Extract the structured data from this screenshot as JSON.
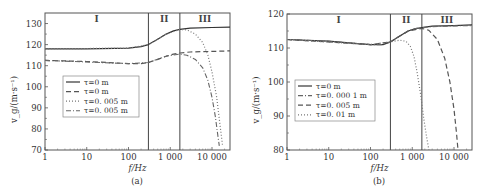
{
  "chart_data": [
    {
      "id": "a",
      "type": "line",
      "caption": "(a)",
      "xlabel": "f/Hz",
      "ylabel": "v_g/(m·s⁻¹)",
      "xscale": "log",
      "xlim": [
        1,
        27000
      ],
      "ylim": [
        70,
        135
      ],
      "xticks": [
        1,
        10,
        100,
        1000,
        10000
      ],
      "xtick_labels": [
        "1",
        "10",
        "100",
        "1 000",
        "10 000"
      ],
      "yticks": [
        70,
        80,
        90,
        100,
        110,
        120,
        130
      ],
      "ytick_labels": [
        "70",
        "80",
        "90",
        "100",
        "110",
        "120",
        "130"
      ],
      "grid": false,
      "regions": [
        {
          "label": "I",
          "x_start": 1,
          "x_end": 300
        },
        {
          "label": "II",
          "x_start": 300,
          "x_end": 1700
        },
        {
          "label": "III",
          "x_start": 1700,
          "x_end": 27000
        }
      ],
      "region_boundaries": [
        300,
        1700
      ],
      "legend_position": "center-left",
      "series": [
        {
          "name": "τ=0 m",
          "style": "solid",
          "x": [
            1,
            10,
            100,
            200,
            300,
            500,
            800,
            1200,
            1700,
            3000,
            10000,
            27000
          ],
          "values": [
            118,
            118,
            118.3,
            119,
            120,
            122.5,
            125,
            126.5,
            127.2,
            127.8,
            128.1,
            128.3
          ]
        },
        {
          "name": "τ=0 m",
          "style": "dashed",
          "x": [
            1,
            10,
            100,
            200,
            300,
            500,
            800,
            1200,
            1700,
            3000,
            10000,
            27000
          ],
          "values": [
            112.5,
            112,
            111,
            111,
            111.5,
            113,
            114.5,
            115.5,
            116,
            116.5,
            116.8,
            117
          ]
        },
        {
          "name": "τ=0. 005 m",
          "style": "dotted",
          "x": [
            1,
            100,
            300,
            800,
            1700,
            2500,
            4000,
            6000,
            8000,
            10000,
            13000,
            16000,
            18000
          ],
          "values": [
            118,
            118.3,
            120,
            125,
            127.2,
            127,
            125,
            121,
            115,
            107,
            95,
            80,
            72
          ]
        },
        {
          "name": "τ=0. 005 m",
          "style": "dash-dot",
          "x": [
            1,
            100,
            300,
            800,
            1700,
            2500,
            4000,
            6000,
            8000,
            10000,
            12000,
            14000,
            15000
          ],
          "values": [
            112.5,
            111,
            111.5,
            114.5,
            115.5,
            115,
            113,
            109,
            103,
            95,
            86,
            76,
            72
          ]
        }
      ]
    },
    {
      "id": "b",
      "type": "line",
      "caption": "(b)",
      "xlabel": "f/Hz",
      "ylabel": "v_g/(m·s⁻¹)",
      "xscale": "log",
      "xlim": [
        1,
        27000
      ],
      "ylim": [
        80,
        120
      ],
      "xticks": [
        1,
        10,
        100,
        1000,
        10000
      ],
      "xtick_labels": [
        "1",
        "10",
        "100",
        "1 000",
        "10 000"
      ],
      "yticks": [
        80,
        90,
        100,
        110,
        120
      ],
      "ytick_labels": [
        "80",
        "90",
        "100",
        "110",
        "120"
      ],
      "grid": false,
      "regions": [
        {
          "label": "I",
          "x_start": 1,
          "x_end": 300
        },
        {
          "label": "II",
          "x_start": 300,
          "x_end": 1700
        },
        {
          "label": "III",
          "x_start": 1700,
          "x_end": 27000
        }
      ],
      "region_boundaries": [
        300,
        1700
      ],
      "legend_position": "lower-left",
      "series": [
        {
          "name": "τ=0 m",
          "style": "solid",
          "x": [
            1,
            10,
            50,
            100,
            200,
            300,
            500,
            800,
            1200,
            1700,
            3000,
            10000,
            27000
          ],
          "values": [
            112.5,
            112,
            111.3,
            111,
            111,
            111.8,
            113.5,
            115,
            115.7,
            116,
            116.4,
            116.6,
            116.8
          ]
        },
        {
          "name": "τ=0. 000 1 m",
          "style": "dash-dot",
          "x": [
            1,
            10,
            50,
            100,
            200,
            300,
            500,
            800,
            1200,
            1700,
            3000,
            10000,
            27000
          ],
          "values": [
            112.5,
            112,
            111.3,
            111,
            111,
            111.8,
            113.5,
            115,
            115.7,
            116,
            116.3,
            116.5,
            116.6
          ]
        },
        {
          "name": "τ=0. 005 m",
          "style": "dashed",
          "x": [
            1,
            100,
            300,
            800,
            1700,
            2500,
            4000,
            6000,
            8000,
            10000,
            11500,
            12500
          ],
          "values": [
            112.5,
            111,
            111.8,
            115,
            115.8,
            115.2,
            112.5,
            107,
            100,
            92,
            85,
            80
          ]
        },
        {
          "name": "τ=0. 01 m",
          "style": "dotted",
          "x": [
            1,
            100,
            300,
            500,
            700,
            900,
            1100,
            1300,
            1600,
            1900,
            2200,
            2500
          ],
          "values": [
            112.5,
            111,
            111.8,
            112.3,
            112,
            110.5,
            107.5,
            103,
            96,
            89,
            84,
            80
          ]
        }
      ]
    }
  ]
}
